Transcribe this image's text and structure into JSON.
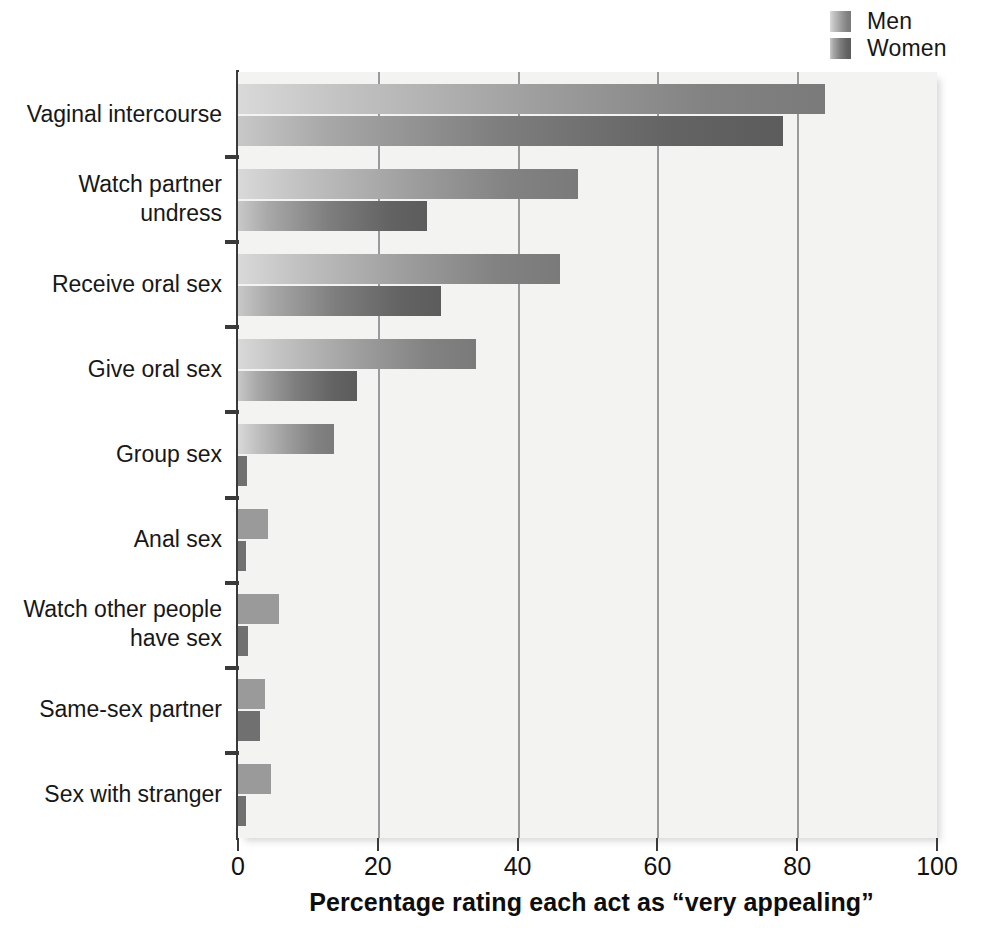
{
  "legend": {
    "position": "top-right",
    "entries": [
      {
        "label": "Men",
        "color": "#9d9d9d"
      },
      {
        "label": "Women",
        "color": "#7e7e7e"
      }
    ]
  },
  "axis": {
    "x_title": "Percentage rating each act as “very appealing”",
    "ticks": [
      "0",
      "20",
      "40",
      "60",
      "80",
      "100"
    ]
  },
  "categories": [
    "Vaginal intercourse",
    "Watch partner\nundress",
    "Receive oral sex",
    "Give oral sex",
    "Group sex",
    "Anal sex",
    "Watch other people\nhave sex",
    "Same-sex partner",
    "Sex with stranger"
  ],
  "chart_data": {
    "type": "bar",
    "orientation": "horizontal",
    "title": "",
    "subtitle": "",
    "xlabel": "Percentage rating each act as “very appealing”",
    "ylabel": "",
    "xlim": [
      0,
      100
    ],
    "xticks": [
      0,
      20,
      40,
      60,
      80,
      100
    ],
    "grid": "vertical gridlines at 20, 40, 60, 80",
    "legend_position": "top-right",
    "categories": [
      "Vaginal intercourse",
      "Watch partner undress",
      "Receive oral sex",
      "Give oral sex",
      "Group sex",
      "Anal sex",
      "Watch other people have sex",
      "Same-sex partner",
      "Sex with stranger"
    ],
    "series": [
      {
        "name": "Men",
        "color": "#9d9d9d",
        "values": [
          84,
          48.6,
          46,
          34,
          13.7,
          4.3,
          5.8,
          3.8,
          4.7
        ]
      },
      {
        "name": "Women",
        "color": "#7e7e7e",
        "values": [
          78,
          27,
          29,
          17,
          1.3,
          1.1,
          1.4,
          3.1,
          1.1
        ]
      }
    ]
  }
}
